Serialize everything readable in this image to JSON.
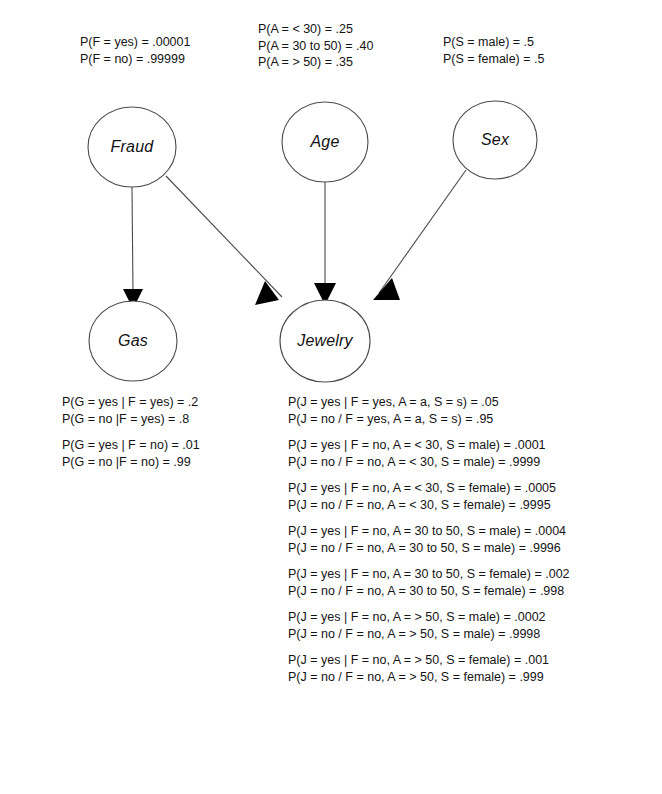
{
  "diagram": {
    "type": "bayesian-network",
    "nodes": [
      {
        "id": "fraud",
        "label": "Fraud",
        "cx": 132,
        "cy": 147,
        "rx": 44,
        "ry": 40
      },
      {
        "id": "age",
        "label": "Age",
        "cx": 325,
        "cy": 142,
        "rx": 43,
        "ry": 40
      },
      {
        "id": "sex",
        "label": "Sex",
        "cx": 495,
        "cy": 140,
        "rx": 42,
        "ry": 39
      },
      {
        "id": "gas",
        "label": "Gas",
        "cx": 133,
        "cy": 341,
        "rx": 44,
        "ry": 40
      },
      {
        "id": "jewelry",
        "label": "Jewelry",
        "cx": 325,
        "cy": 341,
        "rx": 45,
        "ry": 41
      }
    ],
    "edges": [
      {
        "from": "fraud",
        "to": "gas"
      },
      {
        "from": "fraud",
        "to": "jewelry"
      },
      {
        "from": "age",
        "to": "jewelry"
      },
      {
        "from": "sex",
        "to": "jewelry"
      }
    ]
  },
  "priors": {
    "fraud": {
      "variable": "F",
      "lines": [
        "P(F = yes) = .00001",
        "P(F = no) = .99999"
      ]
    },
    "age": {
      "variable": "A",
      "lines": [
        "P(A = < 30) = .25",
        "P(A = 30 to 50) = .40",
        "P(A = > 50) = .35"
      ]
    },
    "sex": {
      "variable": "S",
      "lines": [
        "P(S = male) = .5",
        "P(S = female) = .5"
      ]
    }
  },
  "conditionals": {
    "gas": {
      "variable": "G",
      "groups": [
        [
          "P(G = yes | F = yes) = .2",
          "P(G = no |F = yes) = .8"
        ],
        [
          "P(G = yes | F = no) = .01",
          "P(G = no |F = no) = .99"
        ]
      ]
    },
    "jewelry": {
      "variable": "J",
      "groups": [
        [
          "P(J = yes | F = yes, A = a, S = s) = .05",
          "P(J = no / F = yes, A = a, S = s) = .95"
        ],
        [
          "P(J = yes | F = no, A = < 30, S = male) = .0001",
          "P(J = no / F = no, A = < 30, S = male) = .9999"
        ],
        [
          "P(J = yes | F = no, A = < 30, S = female) = .0005",
          "P(J = no / F = no, A = < 30, S = female) = .9995"
        ],
        [
          "P(J = yes | F = no, A = 30 to 50, S = male) = .0004",
          "P(J = no / F = no, A = 30 to 50, S = male) = .9996"
        ],
        [
          "P(J = yes | F = no, A = 30 to 50, S = female) = .002",
          "P(J = no / F = no, A = 30 to 50, S = female) = .998"
        ],
        [
          "P(J = yes | F = no, A = > 50, S = male) = .0002",
          "P(J = no / F = no, A = > 50, S = male) = .9998"
        ],
        [
          "P(J = yes | F = no, A = > 50, S = female) = .001",
          "P(J = no / F = no, A = > 50, S = female) = .999"
        ]
      ]
    }
  },
  "colors": {
    "background": "#ffffff",
    "node_stroke": "#4a4a4a",
    "edge_stroke": "#4a4a4a",
    "arrow_fill": "#000000",
    "text": "#141414"
  }
}
